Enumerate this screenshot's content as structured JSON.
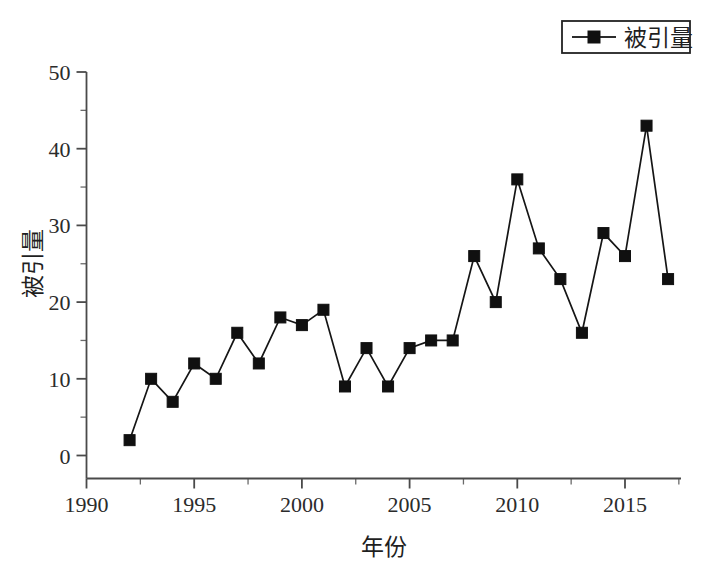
{
  "chart_data": {
    "type": "line",
    "title": "",
    "xlabel": "年份",
    "ylabel": "被引量",
    "xlim": [
      1990,
      2017.6
    ],
    "ylim": [
      0,
      50
    ],
    "grid": false,
    "legend_position": "top-right",
    "series": [
      {
        "name": "被引量",
        "marker": "filled-square",
        "color": "#101010",
        "x": [
          1992,
          1993,
          1994,
          1995,
          1996,
          1997,
          1998,
          1999,
          2000,
          2001,
          2002,
          2003,
          2004,
          2005,
          2006,
          2007,
          2008,
          2009,
          2010,
          2011,
          2012,
          2013,
          2014,
          2015,
          2016,
          2017
        ],
        "values": [
          2,
          10,
          7,
          12,
          10,
          16,
          12,
          18,
          17,
          19,
          9,
          14,
          9,
          14,
          15,
          15,
          26,
          20,
          36,
          27,
          23,
          16,
          29,
          26,
          43,
          23
        ]
      }
    ],
    "x_tick_labels": [
      "1990",
      "1995",
      "2000",
      "2005",
      "2010",
      "2015"
    ],
    "x_tick_values": [
      1990,
      1995,
      2000,
      2005,
      2010,
      2015
    ],
    "x_minor_step": 2.5,
    "y_tick_labels": [
      "0",
      "10",
      "20",
      "30",
      "40",
      "50"
    ],
    "y_tick_values": [
      0,
      10,
      20,
      30,
      40,
      50
    ],
    "y_minor_step": 5
  },
  "legend": {
    "entries": [
      {
        "label": "被引量",
        "marker": "filled-square"
      }
    ]
  },
  "axes": {
    "x_title": "年份",
    "y_title": "被引量"
  },
  "colors": {
    "background": "#ffffff",
    "series": "#101010",
    "axis": "#4a4a4a",
    "text": "#1f1f1f"
  }
}
